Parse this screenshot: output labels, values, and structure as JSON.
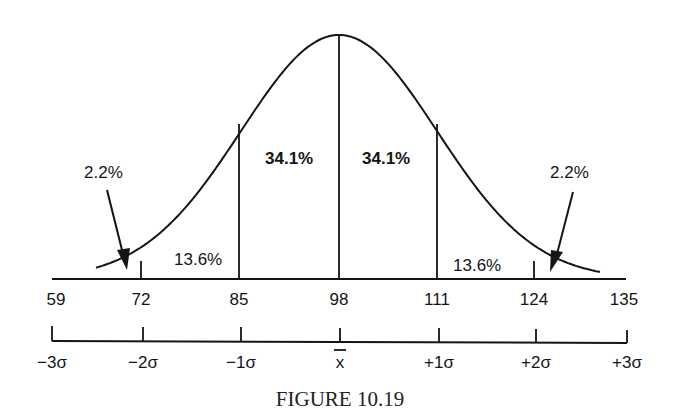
{
  "chart_data": {
    "type": "area",
    "title": "",
    "caption": "FIGURE 10.19",
    "mean": 98,
    "std_dev": 13,
    "x_values": [
      59,
      72,
      85,
      98,
      111,
      124,
      135
    ],
    "x_tick_labels": [
      "59",
      "72",
      "85",
      "98",
      "111",
      "124",
      "135"
    ],
    "sigma_labels": [
      "−3σ",
      "−2σ",
      "−1σ",
      "x̄",
      "+1σ",
      "+2σ",
      "+3σ"
    ],
    "regions": [
      {
        "from": "-3σ",
        "to": "-2σ",
        "percent": "2.2%"
      },
      {
        "from": "-2σ",
        "to": "-1σ",
        "percent": "13.6%"
      },
      {
        "from": "-1σ",
        "to": "mean",
        "percent": "34.1%"
      },
      {
        "from": "mean",
        "to": "+1σ",
        "percent": "34.1%"
      },
      {
        "from": "+1σ",
        "to": "+2σ",
        "percent": "13.6%"
      },
      {
        "from": "+2σ",
        "to": "+3σ",
        "percent": "2.2%"
      }
    ],
    "annotations": [
      "2.2%",
      "2.2%"
    ],
    "grid": false,
    "legend": null
  },
  "labels": {
    "left_tail": "2.2%",
    "left_band": "13.6%",
    "left_center": "34.1%",
    "right_center": "34.1%",
    "right_band": "13.6%",
    "right_tail": "2.2%"
  },
  "x_axis": {
    "ticks": [
      "59",
      "72",
      "85",
      "98",
      "111",
      "124",
      "135"
    ]
  },
  "sigma_axis": {
    "ticks": [
      "−3σ",
      "−2σ",
      "−1σ",
      "x",
      "+1σ",
      "+2σ",
      "+3σ"
    ]
  },
  "caption": "FIGURE 10.19"
}
